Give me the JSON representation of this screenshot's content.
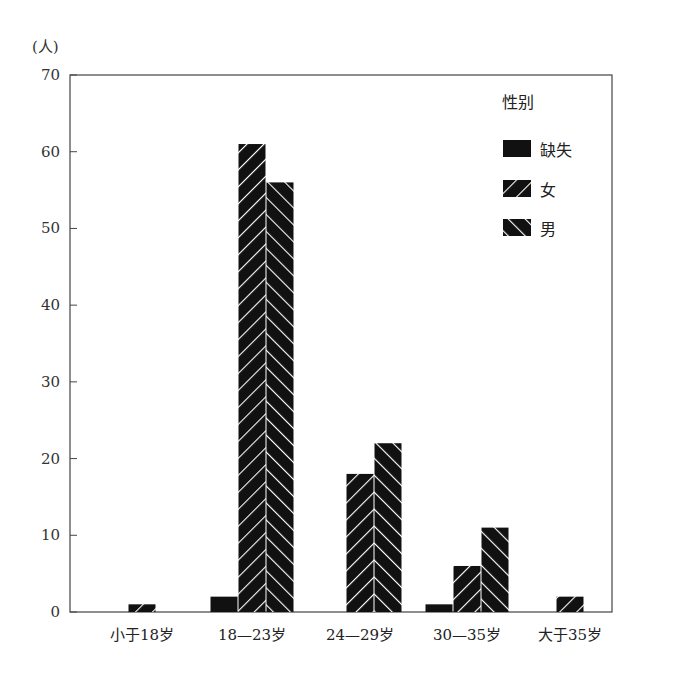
{
  "chart_data": {
    "type": "bar",
    "title": "",
    "ylabel": "(人)",
    "xlabel": "",
    "ylim": [
      0,
      70
    ],
    "yticks": [
      0,
      10,
      20,
      30,
      40,
      50,
      60,
      70
    ],
    "grid": false,
    "legend_title": "性别",
    "legend_position": "top-right (inside)",
    "categories": [
      "小于18岁",
      "18—23岁",
      "24—29岁",
      "30—35岁",
      "大于35岁"
    ],
    "series": [
      {
        "name": "缺失",
        "pattern": "solid",
        "values": [
          0,
          2,
          0,
          1,
          0
        ]
      },
      {
        "name": "女",
        "pattern": "hatch-backslash",
        "values": [
          1,
          61,
          18,
          6,
          2
        ]
      },
      {
        "name": "男",
        "pattern": "hatch-slash",
        "values": [
          0,
          56,
          22,
          11,
          0
        ]
      }
    ]
  },
  "legend": {
    "title": "性别",
    "items": [
      {
        "label": "缺失"
      },
      {
        "label": "女"
      },
      {
        "label": "男"
      }
    ]
  },
  "axis": {
    "y_unit": "(人)"
  },
  "colors": {
    "bar_fill": "#111111",
    "hatch_line": "#ffffff",
    "axis": "#333333"
  }
}
